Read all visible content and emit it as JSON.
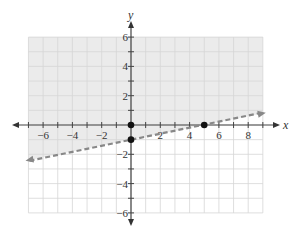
{
  "graph": {
    "x_axis_label": "x",
    "y_axis_label": "y",
    "x_range": [
      -7,
      9
    ],
    "y_range": [
      -6,
      6
    ],
    "x_tick_labels": [
      {
        "value": -6,
        "text": "−6"
      },
      {
        "value": -4,
        "text": "−4"
      },
      {
        "value": -2,
        "text": "−2"
      },
      {
        "value": 2,
        "text": "2"
      },
      {
        "value": 4,
        "text": "4"
      },
      {
        "value": 6,
        "text": "6"
      },
      {
        "value": 8,
        "text": "8"
      }
    ],
    "y_tick_labels": [
      {
        "value": 6,
        "text": "6"
      },
      {
        "value": 4,
        "text": "4"
      },
      {
        "value": 2,
        "text": "2"
      },
      {
        "value": -2,
        "text": "−2"
      },
      {
        "value": -4,
        "text": "−4"
      },
      {
        "value": -6,
        "text": "−6"
      }
    ],
    "boundary_line": {
      "equation": "y = x/5 - 1",
      "style": "dashed",
      "color": "#888888"
    },
    "shaded_region": "above boundary line",
    "shade_color": "#ebebeb",
    "grid_color": "#d6d6d6",
    "points": [
      {
        "x": 0,
        "y": 0
      },
      {
        "x": 0,
        "y": -1
      },
      {
        "x": 5,
        "y": 0
      }
    ]
  }
}
